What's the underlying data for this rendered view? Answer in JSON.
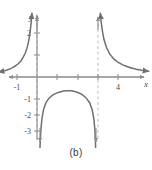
{
  "caption": "(b)",
  "colors": {
    "axis": "#8a8a8a",
    "curve": "#6f6f6f",
    "asymptote": "#b9b9b9",
    "text": "#4a4a4a"
  },
  "axes": {
    "x_label": "x",
    "y_label": "y"
  },
  "chart_data": {
    "type": "line",
    "title": "",
    "subtitle": "",
    "xlabel": "x",
    "ylabel": "y",
    "xlim": [
      -1.9,
      5.6
    ],
    "ylim": [
      -3.7,
      2.9
    ],
    "grid": false,
    "legend": null,
    "x_tick_labels": [
      "-1",
      "4"
    ],
    "x_tick_values": [
      -1,
      4
    ],
    "x_ticks_unlabeled": [
      1,
      2,
      3
    ],
    "y_tick_labels": [
      "2",
      "-1",
      "-2",
      "-3"
    ],
    "y_tick_values": [
      2,
      -1,
      -2,
      -3
    ],
    "y_ticks_unlabeled": [
      1
    ],
    "vertical_asymptotes": [
      0,
      3
    ],
    "horizontal_asymptotes": [
      0
    ],
    "annotations": [
      "Left branch rises to +infinity as x approaches 0 from the left",
      "Middle branch is a downward arch peaking near y = -0.6, falling to -infinity at x = 0 and x = 3",
      "Right branch falls from +infinity at x = 3 toward y = 0"
    ],
    "series": [
      {
        "name": "left-branch",
        "points": [
          [
            -1.9,
            0.22
          ],
          [
            -1.7,
            0.26
          ],
          [
            -1.5,
            0.31
          ],
          [
            -1.3,
            0.38
          ],
          [
            -1.1,
            0.48
          ],
          [
            -0.95,
            0.58
          ],
          [
            -0.8,
            0.72
          ],
          [
            -0.68,
            0.9
          ],
          [
            -0.58,
            1.08
          ],
          [
            -0.5,
            1.3
          ],
          [
            -0.43,
            1.55
          ],
          [
            -0.37,
            1.85
          ],
          [
            -0.32,
            2.2
          ],
          [
            -0.28,
            2.55
          ],
          [
            -0.25,
            2.9
          ]
        ]
      },
      {
        "name": "middle-branch",
        "points": [
          [
            0.13,
            -3.6
          ],
          [
            0.16,
            -2.9
          ],
          [
            0.2,
            -2.3
          ],
          [
            0.25,
            -1.85
          ],
          [
            0.33,
            -1.45
          ],
          [
            0.45,
            -1.15
          ],
          [
            0.6,
            -0.95
          ],
          [
            0.8,
            -0.8
          ],
          [
            1.05,
            -0.7
          ],
          [
            1.3,
            -0.64
          ],
          [
            1.5,
            -0.62
          ],
          [
            1.7,
            -0.63
          ],
          [
            1.95,
            -0.68
          ],
          [
            2.2,
            -0.78
          ],
          [
            2.42,
            -0.95
          ],
          [
            2.6,
            -1.18
          ],
          [
            2.72,
            -1.5
          ],
          [
            2.8,
            -1.9
          ],
          [
            2.85,
            -2.4
          ],
          [
            2.88,
            -3.0
          ],
          [
            2.9,
            -3.6
          ]
        ]
      },
      {
        "name": "right-branch",
        "points": [
          [
            3.12,
            2.9
          ],
          [
            3.16,
            2.5
          ],
          [
            3.22,
            2.1
          ],
          [
            3.3,
            1.7
          ],
          [
            3.42,
            1.35
          ],
          [
            3.58,
            1.05
          ],
          [
            3.78,
            0.82
          ],
          [
            4.0,
            0.66
          ],
          [
            4.3,
            0.52
          ],
          [
            4.6,
            0.42
          ],
          [
            4.9,
            0.35
          ],
          [
            5.2,
            0.3
          ],
          [
            5.5,
            0.26
          ]
        ]
      }
    ]
  }
}
